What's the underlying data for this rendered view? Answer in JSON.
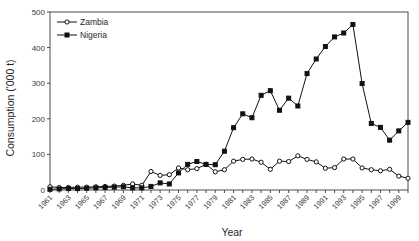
{
  "chart_data": {
    "type": "line",
    "title": "",
    "xlabel": "Year",
    "ylabel": "Consumption ('000 t)",
    "ylim": [
      0,
      500
    ],
    "yticks": [
      0,
      100,
      200,
      300,
      400,
      500
    ],
    "xlim": [
      1961,
      2000
    ],
    "grid": false,
    "legend_position": "top-left",
    "x": [
      1961,
      1962,
      1963,
      1964,
      1965,
      1966,
      1967,
      1968,
      1969,
      1970,
      1971,
      1972,
      1973,
      1974,
      1975,
      1976,
      1977,
      1978,
      1979,
      1980,
      1981,
      1982,
      1983,
      1984,
      1985,
      1986,
      1987,
      1988,
      1989,
      1990,
      1991,
      1992,
      1993,
      1994,
      1995,
      1996,
      1997,
      1998,
      1999,
      2000
    ],
    "xtick_labels": [
      "1961",
      "1963",
      "1965",
      "1967",
      "1969",
      "1971",
      "1973",
      "1975",
      "1977",
      "1979",
      "1981",
      "1983",
      "1985",
      "1987",
      "1989",
      "1991",
      "1993",
      "1995",
      "1997",
      "1999"
    ],
    "series": [
      {
        "name": "Zambia",
        "marker": "open-circle",
        "values": [
          9,
          7,
          7,
          8,
          8,
          9,
          10,
          11,
          13,
          17,
          13,
          52,
          41,
          43,
          62,
          57,
          60,
          72,
          51,
          57,
          81,
          86,
          87,
          78,
          58,
          81,
          80,
          96,
          86,
          79,
          61,
          63,
          87,
          87,
          62,
          57,
          54,
          58,
          39,
          33
        ]
      },
      {
        "name": "Nigeria",
        "marker": "filled-square",
        "values": [
          2,
          3,
          4,
          4,
          5,
          6,
          7,
          8,
          9,
          6,
          6,
          10,
          20,
          17,
          48,
          72,
          80,
          72,
          71,
          109,
          175,
          214,
          203,
          266,
          279,
          224,
          258,
          236,
          327,
          368,
          403,
          430,
          441,
          465,
          299,
          187,
          176,
          140,
          166,
          190
        ]
      }
    ]
  },
  "legend": {
    "items": [
      {
        "label": "Zambia"
      },
      {
        "label": "Nigeria"
      }
    ]
  },
  "axes": {
    "y_title": "Consumption ('000 t)",
    "x_title": "Year"
  }
}
